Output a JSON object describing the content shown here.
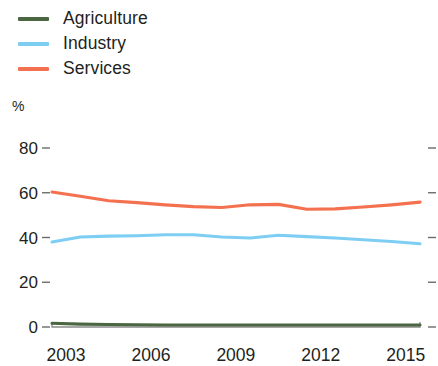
{
  "legend": {
    "position": "top-left",
    "items": [
      {
        "label": "Agriculture",
        "color": "#4a6741",
        "swatch_name": "legend-swatch-agriculture"
      },
      {
        "label": "Industry",
        "color": "#7ecef4",
        "swatch_name": "legend-swatch-industry"
      },
      {
        "label": "Services",
        "color": "#f4714f",
        "swatch_name": "legend-swatch-services"
      }
    ]
  },
  "axis": {
    "unit_label": "%",
    "y_ticks": [
      "80",
      "60",
      "40",
      "20",
      "0"
    ],
    "x_ticks": [
      "2003",
      "2006",
      "2009",
      "2012",
      "2015"
    ]
  },
  "chart_data": {
    "type": "line",
    "title": "",
    "subtitle": "",
    "xlabel": "",
    "ylabel": "%",
    "ylim": [
      0,
      80
    ],
    "xlim": [
      2003,
      2016
    ],
    "grid": false,
    "legend_position": "top-left",
    "x": [
      2003,
      2004,
      2005,
      2006,
      2007,
      2008,
      2009,
      2010,
      2011,
      2012,
      2013,
      2014,
      2015,
      2016
    ],
    "series": [
      {
        "name": "Agriculture",
        "color": "#4a6741",
        "values": [
          1.7,
          1.3,
          1.1,
          1.0,
          0.9,
          0.9,
          0.9,
          0.9,
          0.9,
          0.9,
          0.9,
          0.9,
          0.9,
          0.9
        ]
      },
      {
        "name": "Industry",
        "color": "#7ecef4",
        "values": [
          38.0,
          40.2,
          40.6,
          40.8,
          41.2,
          41.2,
          40.2,
          39.8,
          41.0,
          40.4,
          39.8,
          39.0,
          38.2,
          37.2
        ]
      },
      {
        "name": "Services",
        "color": "#f4714f",
        "values": [
          60.3,
          58.4,
          56.4,
          55.6,
          54.6,
          53.8,
          53.4,
          54.6,
          54.8,
          52.6,
          52.8,
          53.6,
          54.6,
          55.8
        ]
      }
    ],
    "annotations": []
  }
}
